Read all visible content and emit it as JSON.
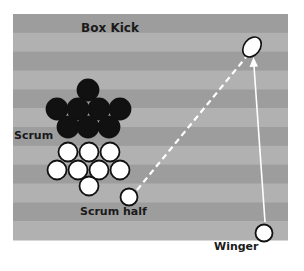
{
  "title": "Box Kick",
  "labels": {
    "scrum": "Scrum",
    "scrum_half": "Scrum half",
    "winger": "Winger"
  },
  "colors": {
    "stripe_dark": "#9d9d9d",
    "stripe_light": "#b1b1b1",
    "player_black": "#111111",
    "player_white": "#ffffff",
    "outline": "#111111",
    "line": "#ffffff"
  },
  "field": {
    "x": 13,
    "y": 14,
    "width": 275,
    "height": 226,
    "stripes": 12
  },
  "scrum_black_players": [
    {
      "x": 88,
      "y": 90
    },
    {
      "x": 57,
      "y": 109
    },
    {
      "x": 78,
      "y": 109
    },
    {
      "x": 99,
      "y": 109
    },
    {
      "x": 120,
      "y": 109
    },
    {
      "x": 68,
      "y": 127
    },
    {
      "x": 88,
      "y": 127
    },
    {
      "x": 109,
      "y": 127
    }
  ],
  "scrum_white_players": [
    {
      "x": 68,
      "y": 152
    },
    {
      "x": 89,
      "y": 152
    },
    {
      "x": 110,
      "y": 152
    },
    {
      "x": 57,
      "y": 170
    },
    {
      "x": 78,
      "y": 170
    },
    {
      "x": 99,
      "y": 170
    },
    {
      "x": 120,
      "y": 170
    },
    {
      "x": 89,
      "y": 186
    }
  ],
  "scrum_half": {
    "x": 129,
    "y": 197
  },
  "winger": {
    "x": 264,
    "y": 233
  },
  "ball": {
    "x": 252,
    "y": 47
  },
  "kick_path": {
    "from": "scrum_half",
    "to": "ball",
    "style": "dashed"
  },
  "winger_run": {
    "from": "winger",
    "to": "ball",
    "style": "solid-arrow"
  }
}
